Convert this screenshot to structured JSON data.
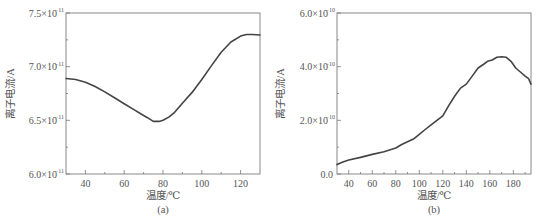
{
  "chart_data": [
    {
      "panel": "(a)",
      "type": "line",
      "title": "",
      "xlabel": "温度/℃",
      "ylabel": "离子电流/A",
      "caption": "(a)",
      "xlim": [
        30,
        130
      ],
      "ylim": [
        6e-11,
        7.5e-11
      ],
      "xticks": [
        40,
        60,
        80,
        100,
        120
      ],
      "xminor": [
        30,
        50,
        70,
        90,
        110,
        130
      ],
      "yticks": [
        {
          "value": 6e-11,
          "mant": "6.0×10",
          "exp": "−11"
        },
        {
          "value": 6.5e-11,
          "mant": "6.5×10",
          "exp": "−11"
        },
        {
          "value": 7e-11,
          "mant": "7.0×10",
          "exp": "−11"
        },
        {
          "value": 7.5e-11,
          "mant": "7.5×10",
          "exp": "−11"
        }
      ],
      "yminor": [
        6.25e-11,
        6.75e-11,
        7.25e-11
      ],
      "grid": false,
      "series": [
        {
          "name": "ion current",
          "x": [
            30,
            35,
            40,
            45,
            50,
            55,
            60,
            65,
            70,
            72,
            75,
            78,
            80,
            83,
            86,
            90,
            95,
            100,
            105,
            110,
            115,
            120,
            123,
            126,
            130
          ],
          "y": [
            6.89e-11,
            6.88e-11,
            6.855e-11,
            6.815e-11,
            6.765e-11,
            6.71e-11,
            6.655e-11,
            6.6e-11,
            6.545e-11,
            6.525e-11,
            6.49e-11,
            6.49e-11,
            6.5e-11,
            6.53e-11,
            6.575e-11,
            6.66e-11,
            6.76e-11,
            6.88e-11,
            7.01e-11,
            7.135e-11,
            7.23e-11,
            7.285e-11,
            7.3e-11,
            7.3e-11,
            7.295e-11
          ]
        }
      ]
    },
    {
      "panel": "(b)",
      "type": "line",
      "title": "",
      "xlabel": "温度/℃",
      "ylabel": "离子电流/A",
      "caption": "(b)",
      "xlim": [
        30,
        195
      ],
      "ylim": [
        0,
        6e-10
      ],
      "xticks": [
        40,
        60,
        80,
        100,
        120,
        140,
        160,
        180
      ],
      "xminor": [
        30,
        50,
        70,
        90,
        110,
        130,
        150,
        170,
        190
      ],
      "yticks": [
        {
          "value": 0,
          "mant": "0.0",
          "exp": ""
        },
        {
          "value": 2e-10,
          "mant": "2.0×10",
          "exp": "−10"
        },
        {
          "value": 4e-10,
          "mant": "4.0×10",
          "exp": "−10"
        },
        {
          "value": 6e-10,
          "mant": "6.0×10",
          "exp": "−10"
        }
      ],
      "yminor": [
        1e-10,
        3e-10,
        5e-10
      ],
      "grid": false,
      "series": [
        {
          "name": "ion current",
          "x": [
            30,
            35,
            40,
            50,
            60,
            70,
            80,
            85,
            90,
            95,
            100,
            105,
            110,
            115,
            120,
            125,
            130,
            135,
            140,
            145,
            150,
            155,
            158,
            162,
            166,
            170,
            174,
            178,
            182,
            186,
            190,
            193,
            195
          ],
          "y": [
            3.5e-11,
            4.5e-11,
            5.2e-11,
            6.2e-11,
            7.3e-11,
            8.3e-11,
            9.7e-11,
            1.1e-10,
            1.2e-10,
            1.3e-10,
            1.48e-10,
            1.66e-10,
            1.83e-10,
            2e-10,
            2.17e-10,
            2.55e-10,
            2.9e-10,
            3.2e-10,
            3.35e-10,
            3.65e-10,
            3.95e-10,
            4.1e-10,
            4.2e-10,
            4.25e-10,
            4.35e-10,
            4.37e-10,
            4.35e-10,
            4.2e-10,
            3.95e-10,
            3.8e-10,
            3.65e-10,
            3.55e-10,
            3.35e-10
          ]
        }
      ]
    }
  ],
  "panels": {
    "a": {
      "caption": "(a)",
      "xlabel": "温度/℃",
      "ylabel": "离子电流/A"
    },
    "b": {
      "caption": "(b)",
      "xlabel": "温度/℃",
      "ylabel": "离子电流/A"
    }
  }
}
